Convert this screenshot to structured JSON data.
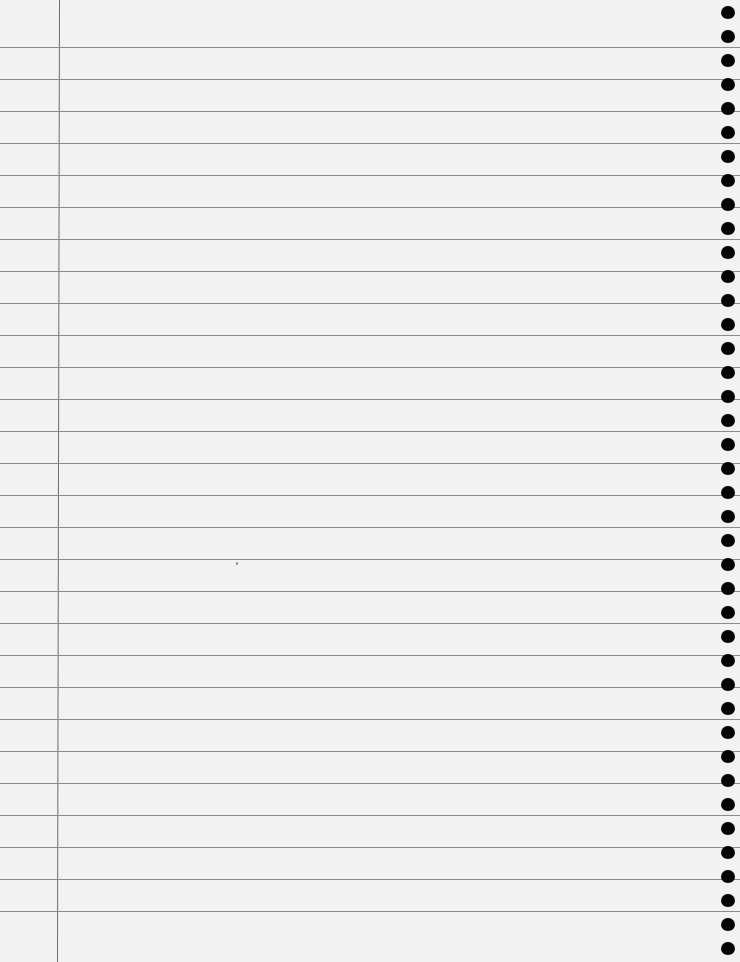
{
  "page": {
    "type": "lined-notebook-paper",
    "paper_color": "#f2f2f1",
    "rule_color": "#8a8a8a",
    "margin_line_color": "#6e6e6e",
    "hole_color": "#050505",
    "rules": {
      "first_y": 47,
      "spacing": 32,
      "count": 28
    },
    "margin_line": {
      "x": 59
    },
    "spiral_holes": {
      "x": 721,
      "first_y": 6,
      "spacing": 24,
      "count": 40
    },
    "specks": [
      {
        "x": 236,
        "y": 562
      }
    ]
  }
}
